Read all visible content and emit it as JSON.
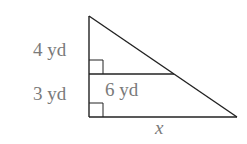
{
  "diagram": {
    "type": "similar-triangles",
    "labels": {
      "upper_vertical": "4 yd",
      "lower_vertical": "3 yd",
      "inner_horizontal": "6 yd",
      "bottom_base": "x"
    },
    "line_color": "#222222",
    "label_color": "#7a7a7a"
  }
}
